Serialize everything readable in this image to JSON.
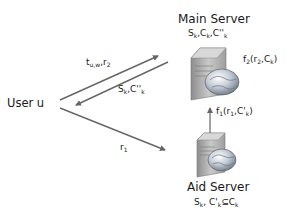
{
  "nodes": {
    "main_server": {
      "title": "Main Server",
      "data": {
        "s": "S",
        "s_sub": "k",
        "c": "C",
        "c_sub": "k",
        "c2": "C''",
        "c2_sub": "k"
      },
      "function": {
        "name": "f",
        "name_sub": "2",
        "arg1": "r",
        "arg1_sub": "2",
        "arg2": "C",
        "arg2_sub": "k"
      }
    },
    "aid_server": {
      "title": "Aid Server",
      "data": {
        "s": "S",
        "s_sub": "k",
        "c": "C'",
        "c_sub": "k",
        "subset": "⊆",
        "c_full": "C",
        "c_full_sub": "k"
      },
      "function": {
        "name": "f",
        "name_sub": "1",
        "arg1": "r",
        "arg1_sub": "1",
        "arg2": "C'",
        "arg2_sub": "k"
      }
    },
    "user": {
      "label": "User u"
    }
  },
  "edges": [
    {
      "from": "user",
      "to": "main_server",
      "label": "t",
      "label_sub": "u,w",
      "label2": "r",
      "label2_sub": "2"
    },
    {
      "from": "main_server",
      "to": "user",
      "label": "S",
      "label_sub": "k",
      "label2": "C''",
      "label2_sub": "k"
    },
    {
      "from": "user",
      "to": "aid_server",
      "label": "r",
      "label_sub": "1"
    },
    {
      "from": "aid_server",
      "to": "main_server",
      "label_ref": "aid_server.function"
    }
  ],
  "colors": {
    "arrow": "#666666",
    "text": "#1a1a1a",
    "server_body": "#b8b8b8",
    "globe": "#9aa4b0"
  }
}
